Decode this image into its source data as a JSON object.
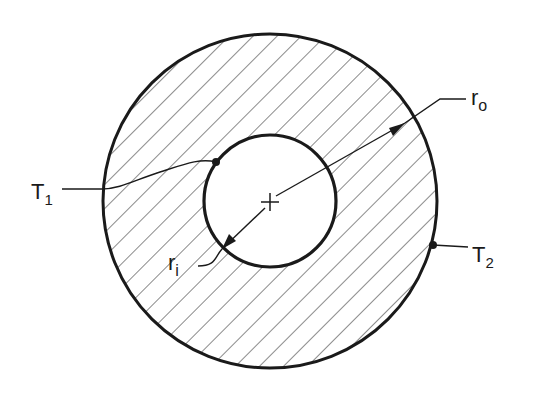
{
  "diagram": {
    "labels": {
      "T1": {
        "main": "T",
        "sub": "1"
      },
      "T2": {
        "main": "T",
        "sub": "2"
      },
      "ro": {
        "main": "r",
        "sub": "o"
      },
      "ri": {
        "main": "r",
        "sub": "i"
      }
    },
    "geometry": {
      "center": [
        270,
        201
      ],
      "outer_radius": 167,
      "inner_radius": 66
    },
    "colors": {
      "stroke": "#1a1a1a",
      "hatch": "#2a2a2a",
      "background": "#ffffff"
    }
  }
}
